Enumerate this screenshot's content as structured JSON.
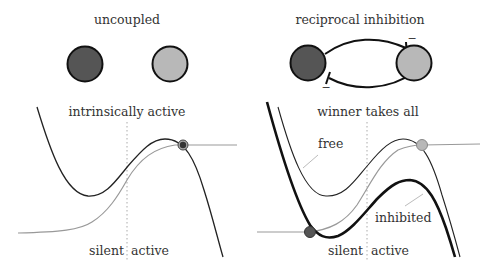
{
  "colors": {
    "dark_neuron": "#555555",
    "light_neuron": "#b8b8b8",
    "outline": "#111111",
    "curve_dark": "#222222",
    "curve_gray": "#999999",
    "dotted": "#aaaaaa",
    "text": "#333333"
  },
  "left": {
    "top_title": "uncoupled",
    "bottom_title": "intrinsically active",
    "axis_left_label": "silent",
    "axis_right_label": "active",
    "neurons": [
      "dark-neuron",
      "light-neuron"
    ]
  },
  "right": {
    "top_title": "reciprocal inhibition",
    "bottom_title": "winner takes all",
    "axis_left_label": "silent",
    "axis_right_label": "active",
    "inhibition_marks": [
      "−",
      "−"
    ],
    "curve_labels": {
      "free": "free",
      "inhibited": "inhibited"
    },
    "neurons": [
      "dark-neuron",
      "light-neuron"
    ]
  }
}
